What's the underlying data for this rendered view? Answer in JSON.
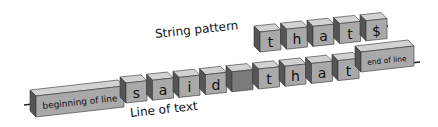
{
  "diagram": {
    "pattern_label": "String pattern",
    "text_label": "Line of text",
    "pattern_chars": [
      "t",
      "h",
      "a",
      "t",
      "$"
    ],
    "text_start": "beginning of line",
    "text_chars": [
      "s",
      "a",
      "i",
      "d",
      " ",
      "t",
      "h",
      "a",
      "t"
    ],
    "text_end": "end of line",
    "colors": {
      "box_front": "#a9a9a9",
      "box_top": "#d2d2d2",
      "box_side": "#6e6e6e",
      "space_box_front": "#7a7a7a",
      "line": "#222222"
    }
  }
}
